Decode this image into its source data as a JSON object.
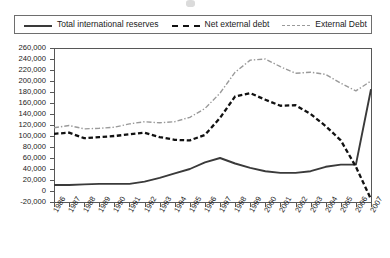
{
  "chart_data": {
    "type": "line",
    "title": "",
    "xlabel": "",
    "ylabel": "",
    "ylim": [
      -20000,
      260000
    ],
    "ytick_step": 20000,
    "grid": false,
    "legend_position": "top",
    "categories": [
      "1986",
      "1987",
      "1988",
      "1989",
      "1990",
      "1991",
      "1992",
      "1993",
      "1994",
      "1995",
      "1996",
      "1997",
      "1998",
      "1999",
      "2000",
      "2001",
      "2002",
      "2003",
      "2004",
      "2005",
      "2006",
      "2007"
    ],
    "ytick_labels": [
      "260,000",
      "240,000",
      "220,000",
      "200,000",
      "180,000",
      "160,000",
      "140,000",
      "120,000",
      "100,000",
      "80,000",
      "60,000",
      "40,000",
      "20,000",
      "0",
      "-20,000"
    ],
    "ytick_values": [
      260000,
      240000,
      220000,
      200000,
      180000,
      160000,
      140000,
      120000,
      100000,
      80000,
      60000,
      40000,
      20000,
      0,
      -20000
    ],
    "series": [
      {
        "name": "Total international reserves",
        "style": "solid",
        "color": "#3a3a3a",
        "values": [
          11000,
          11000,
          12000,
          13000,
          13000,
          13000,
          17000,
          24000,
          32000,
          40000,
          52000,
          60000,
          50000,
          42000,
          36000,
          33000,
          33000,
          36000,
          44000,
          48000,
          48000,
          185000
        ]
      },
      {
        "name": "Net external debt",
        "style": "dashed",
        "color": "#111111",
        "values": [
          104000,
          106000,
          96000,
          98000,
          100000,
          103000,
          106000,
          98000,
          93000,
          92000,
          102000,
          133000,
          172000,
          178000,
          166000,
          155000,
          156000,
          140000,
          118000,
          92000,
          44000,
          -15000
        ]
      },
      {
        "name": "External Debt",
        "style": "dash-dot",
        "color": "#9a9a9a",
        "values": [
          115000,
          119000,
          113000,
          114000,
          116000,
          122000,
          126000,
          124000,
          126000,
          134000,
          150000,
          178000,
          216000,
          238000,
          240000,
          226000,
          214000,
          216000,
          212000,
          196000,
          182000,
          200000
        ]
      }
    ]
  },
  "legend": {
    "entries": [
      {
        "label": "Total international reserves",
        "swatch": "solid-line-swatch"
      },
      {
        "label": "Net external debt",
        "swatch": "dashed-line-swatch"
      },
      {
        "label": "External Debt",
        "swatch": "dash-dot-line-swatch"
      }
    ]
  }
}
